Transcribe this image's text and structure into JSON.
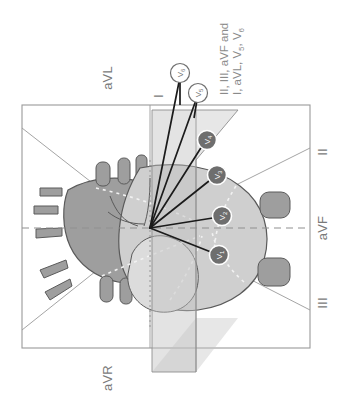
{
  "figure": {
    "type": "anatomical-diagram",
    "background_color": "#ffffff",
    "frame": {
      "stroke": "#9a9a9a",
      "x": 22,
      "y": 105,
      "width": 288,
      "height": 243
    }
  },
  "limb_lead_labels": {
    "lead_I": "I",
    "lead_II": "II",
    "lead_III": "III",
    "lead_aVR": "aVR",
    "lead_aVL": "aVL",
    "lead_aVF": "aVF"
  },
  "caption": {
    "line1": "II, III, aVF and",
    "line2_prefix": "I, aVL, V",
    "line2_sub1": "5",
    "line2_mid": ", V",
    "line2_sub2": "6",
    "full_text": "II, III, aVF and I, aVL, V5, V6"
  },
  "precordial_leads": [
    {
      "name": "V",
      "sub": "1",
      "style": "dark",
      "cx": 219,
      "cy": 255,
      "fill": "#6e6e6e",
      "text_fill": "#ffffff"
    },
    {
      "name": "V",
      "sub": "2",
      "style": "dark",
      "cx": 222,
      "cy": 216,
      "fill": "#6e6e6e",
      "text_fill": "#ffffff"
    },
    {
      "name": "V",
      "sub": "3",
      "style": "dark",
      "cx": 217,
      "cy": 175,
      "fill": "#6e6e6e",
      "text_fill": "#ffffff"
    },
    {
      "name": "V",
      "sub": "4",
      "style": "dark",
      "cx": 207,
      "cy": 140,
      "fill": "#6e6e6e",
      "text_fill": "#ffffff"
    },
    {
      "name": "V",
      "sub": "5",
      "style": "light",
      "cx": 198,
      "cy": 93,
      "fill": "#ffffff",
      "text_fill": "#6f6f6f"
    },
    {
      "name": "V",
      "sub": "6",
      "style": "light",
      "cx": 180,
      "cy": 73,
      "fill": "#ffffff",
      "text_fill": "#6f6f6f"
    }
  ],
  "electrical_center": {
    "x": 150,
    "y": 228
  },
  "colors": {
    "frame_line": "#9a9a9a",
    "axis_line": "#9a9a9a",
    "dashed_axis": "#8f8f8f",
    "vector_line": "#1b1b1b",
    "heart_dark": "#9e9e9e",
    "heart_mid": "#b5b5b5",
    "heart_light": "#cfcfcf",
    "heart_pale": "#dcdcdc",
    "heart_outline": "#5a5a5a",
    "plane_fill": "#c2c2c2",
    "plane_stroke": "#8f8f8f",
    "lead_marker_dark": "#6e6e6e",
    "lead_marker_light": "#ffffff",
    "label_text": "#7a7a7a",
    "caption_text": "#8a8a8a",
    "dotted_internal": "#f2f2f2"
  }
}
